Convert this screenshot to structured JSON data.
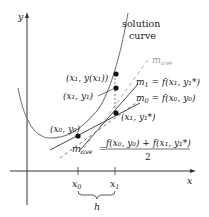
{
  "diagram": {
    "axes": {
      "x_label": "x",
      "y_label": "y"
    },
    "ticks": {
      "x0": {
        "base": "x",
        "sub": "0"
      },
      "x1": {
        "base": "x",
        "sub": "1"
      }
    },
    "step_label": "h",
    "curve_label": {
      "line1": "solution",
      "line2": "curve"
    },
    "points": {
      "p0": {
        "label": "(x₀, y₀)"
      },
      "p_exact": {
        "label": "(x₁, y(x₁))"
      },
      "p_y1": {
        "label": "(x₁, y₁)"
      },
      "p_star": {
        "label": "(x₁, y₁*)"
      }
    },
    "slopes": {
      "m_ave": {
        "label": "m",
        "sub": "ave"
      },
      "m1": {
        "label": "m",
        "sub": "1",
        "expr": " = f(x₁, y₁*)"
      },
      "m0": {
        "label": "m",
        "sub": "0",
        "expr": " = f(x₀, y₀)"
      }
    },
    "formula": {
      "lhs": "m",
      "lhs_sub": "ave",
      "equals": "=",
      "numerator": "f(x₀, y₀) + f(x₁, y₁*)",
      "denominator": "2"
    },
    "colors": {
      "curve": "#7a7a7a",
      "axis": "#333333",
      "tangent": "#333333",
      "m_ave_line": "#b0b0b0",
      "point": "#111111",
      "m_ave_label": "#9a9a9a"
    }
  }
}
